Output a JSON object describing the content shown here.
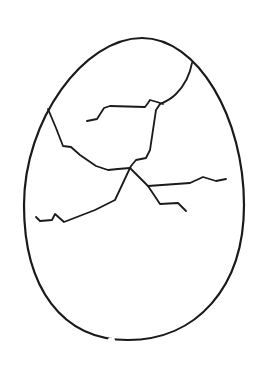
{
  "drawing": {
    "title": "Cracked egg line drawing",
    "background": "#ffffff",
    "stroke_color": "#1a1a1a",
    "outline_stroke_width": 2.2,
    "crack_stroke_width": 1.8,
    "egg_outline": "M142,38 C198,38 244,118 244,205 C244,288 196,340 128,340 C62,340 24,288 24,205 C24,120 84,38 142,38 Z",
    "outline_gap": "M110,339.6 L113,339.8",
    "cracks": [
      {
        "id": "crack-top-right",
        "path": "M192,63 C190,74 184,86 176,94 C171,99 165,102 160,104"
      },
      {
        "id": "crack-upper-short",
        "path": "M87,121 L97,119 L104,108 L110,106 L145,107 L148,103 L150,100 L157,102 L163,104"
      },
      {
        "id": "crack-center-vertical",
        "path": "M160,104 L156,110 L150,150 L146,158 L136,160 L131,166 L130,168"
      },
      {
        "id": "crack-left",
        "path": "M48,109 L56,128 L63,146 L71,147 L80,155 L96,166 L108,170 L118,169 L130,168"
      },
      {
        "id": "crack-lower-left",
        "path": "M130,168 L115,200 L95,210 L64,222 L55,214 L52,220 L40,221 L36,217"
      },
      {
        "id": "crack-lower-right",
        "path": "M130,168 L148,186 L160,204 L178,203 L186,211"
      },
      {
        "id": "crack-right-branch",
        "path": "M148,186 L190,183 L203,177 L216,181 L226,179"
      }
    ]
  }
}
